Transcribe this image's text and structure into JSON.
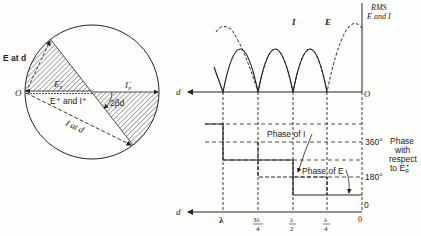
{
  "figure": {
    "circle_diagram": {
      "labels": {
        "e_at_d": "E at d",
        "origin": "O",
        "er_minus": "E",
        "er_minus_sub": "R",
        "er_minus_sup": "−",
        "ir_minus": "I",
        "ir_minus_sub": "R",
        "ir_minus_sup": "−",
        "e_plus_i_plus": "E⁺ and I⁺",
        "angle": "2βd",
        "i_at_d": "I at d"
      }
    },
    "rms_plot": {
      "axis_title_line1": "RMS",
      "axis_title_line2": "E and I",
      "curve_i_label": "I",
      "curve_e_label": "E",
      "origin_label": "O",
      "x_arrow_label": "d"
    },
    "phase_plot": {
      "phase_of_i": "Phase of I",
      "phase_of_e": "Phase of E",
      "tick_360": "360°",
      "tick_180": "180°",
      "tick_0": "0",
      "side_label": [
        "Phase",
        "with",
        "respect",
        "to E"
      ],
      "side_label_sub": "R",
      "side_label_sup": "+",
      "x_arrow_label": "d",
      "x_ticks": [
        {
          "num": "λ",
          "den": ""
        },
        {
          "num": "3λ",
          "den": "4"
        },
        {
          "num": "λ",
          "den": "2"
        },
        {
          "num": "λ",
          "den": "4"
        },
        {
          "num": "0",
          "den": ""
        }
      ]
    }
  }
}
